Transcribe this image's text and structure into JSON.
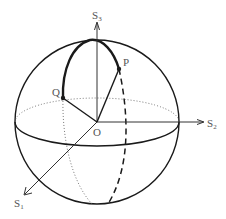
{
  "diagram": {
    "axes": [
      {
        "id": "s1",
        "label": "S",
        "subscript": "1"
      },
      {
        "id": "s2",
        "label": "S",
        "subscript": "2"
      },
      {
        "id": "s3",
        "label": "S",
        "subscript": "3"
      }
    ],
    "points": [
      {
        "id": "origin",
        "label": "O"
      },
      {
        "id": "p",
        "label": "P"
      },
      {
        "id": "q",
        "label": "Q"
      }
    ],
    "colors": {
      "stroke": "#1a1a1a",
      "label": "#555555",
      "background": "#ffffff"
    }
  }
}
